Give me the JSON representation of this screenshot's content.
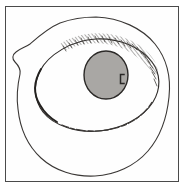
{
  "figure": {
    "title": "Concentric blob drawing with shaded central disc",
    "medium": "line drawing",
    "background_color": "#ffffff",
    "frame": {
      "present": true,
      "style": "thin rectangular rule",
      "stroke_color": "#4a4a4a",
      "stroke_width_px": 1,
      "inset_left_px": 5,
      "inset_top_px": 6,
      "width_px": 174,
      "height_px": 176
    },
    "ink_color": "#33302e",
    "layers": [
      {
        "name": "outer-contour",
        "label": "Outer irregular blob outline",
        "shape": "closed irregular rounded outline with a notch on the left side",
        "fill": "none",
        "stroke_color": "#3a3735",
        "stroke_width_px": 1.1
      },
      {
        "name": "inner-contour",
        "label": "Inner oval ring",
        "shape": "tilted oval, thicker darker stroke on the left flank",
        "fill": "none",
        "stroke_color": "#2e2b29",
        "stroke_width_px": 1.3
      },
      {
        "name": "hatching-band",
        "label": "Dense hatching band along the upper-right of the inner oval",
        "shape": "crescent of short stipple strokes",
        "stroke_color": "#4a4745"
      },
      {
        "name": "central-disc",
        "label": "Shaded central disc",
        "shape": "circle",
        "fill_color": "#a9a7a4",
        "stroke_color": "#2b2927",
        "stroke_width_px": 1.4,
        "center_x_px": 106,
        "center_y_px": 75,
        "radius_x_px": 22,
        "radius_y_px": 24
      },
      {
        "name": "disc-edge-hatching",
        "label": "Hatching along left and lower-left rim of the central disc",
        "stroke_color": "#4d4a48"
      },
      {
        "name": "disc-notch-mark",
        "label": "Small dark bracket mark near the right edge of the disc",
        "shape": "open bracket / C",
        "stroke_color": "#2a2827",
        "center_x_px": 122,
        "center_y_px": 79,
        "width_px": 5,
        "height_px": 9
      }
    ]
  }
}
